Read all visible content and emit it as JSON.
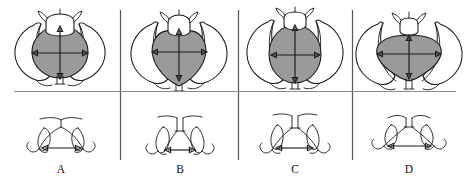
{
  "figure": {
    "type": "anatomical-diagram",
    "background_color": "#ffffff",
    "ink_color": "#1a1a1a",
    "inlet_shade_color": "#9a9a9a",
    "divider_color": "#585858",
    "horizontal_divider_color": "#8a8a8a",
    "rows": [
      {
        "name": "pelvic-inlet-row",
        "view": "inlet (superior) view with AP and transverse diameter arrows"
      },
      {
        "name": "subpubic-arch-row",
        "view": "anterior view of subpubic arch with intertuberous diameter arrow"
      }
    ],
    "layout": {
      "columns": 4,
      "divider_x": [
        120,
        238,
        352
      ],
      "horizontal_divider_y": 91
    }
  },
  "panels": [
    {
      "label": "A",
      "name": "gynecoid",
      "inlet_shape": "round",
      "inlet_cx": 60,
      "inlet_cy": 52,
      "inlet_rx": 28,
      "inlet_ry": 26,
      "ap_arrow": {
        "x": 60,
        "y1": 27,
        "y2": 78
      },
      "tr_arrow": {
        "y": 53,
        "x1": 32,
        "x2": 88
      },
      "arch_width": "wide",
      "arch_arrow": {
        "y": 148,
        "x1": 43,
        "x2": 80
      },
      "arch_apex_x": 61
    },
    {
      "label": "B",
      "name": "android",
      "inlet_shape": "heart-shaped",
      "inlet_cx": 179,
      "inlet_cy": 54,
      "inlet_rx": 28,
      "inlet_ry": 26,
      "ap_arrow": {
        "x": 179,
        "y1": 30,
        "y2": 80
      },
      "tr_arrow": {
        "y": 52,
        "x1": 152,
        "x2": 207
      },
      "arch_width": "narrow",
      "arch_arrow": {
        "y": 150,
        "x1": 166,
        "x2": 194
      },
      "arch_apex_x": 180
    },
    {
      "label": "C",
      "name": "anthropoid",
      "inlet_shape": "long oval (anteroposterior)",
      "inlet_cx": 295,
      "inlet_cy": 54,
      "inlet_rx": 26,
      "inlet_ry": 29,
      "ap_arrow": {
        "x": 295,
        "y1": 25,
        "y2": 82
      },
      "tr_arrow": {
        "y": 55,
        "x1": 271,
        "x2": 320
      },
      "arch_width": "moderate",
      "arch_arrow": {
        "y": 148,
        "x1": 277,
        "x2": 312
      },
      "arch_apex_x": 295
    },
    {
      "label": "D",
      "name": "platypelloid",
      "inlet_shape": "wide flat oval (transverse)",
      "inlet_cx": 409,
      "inlet_cy": 55,
      "inlet_rx": 32,
      "inlet_ry": 22,
      "ap_arrow": {
        "x": 409,
        "y1": 36,
        "y2": 79
      },
      "tr_arrow": {
        "y": 54,
        "x1": 377,
        "x2": 441
      },
      "arch_width": "very wide and flat",
      "arch_arrow": {
        "y": 146,
        "x1": 388,
        "x2": 430
      },
      "arch_apex_x": 409
    }
  ],
  "labels": {
    "a": "A",
    "b": "B",
    "c": "C",
    "d": "D",
    "label_y": 173
  }
}
